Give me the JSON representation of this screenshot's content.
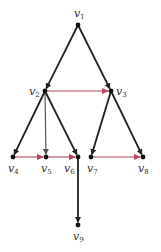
{
  "diagram": {
    "type": "directed-tree",
    "colors": {
      "tree_edge": "#222222",
      "light_edge": "#555555",
      "cross_edge": "#b04a5a",
      "node": "#111111"
    },
    "nodes": [
      {
        "id": "v1",
        "label": "v",
        "sub": "1",
        "x": 78,
        "y": 25,
        "lx": 74,
        "ly": 17
      },
      {
        "id": "v2",
        "label": "v",
        "sub": "2",
        "x": 45,
        "y": 91,
        "lx": 29,
        "ly": 95
      },
      {
        "id": "v3",
        "label": "v",
        "sub": "3",
        "x": 111,
        "y": 91,
        "lx": 116,
        "ly": 95
      },
      {
        "id": "v4",
        "label": "v",
        "sub": "4",
        "x": 13,
        "y": 157,
        "lx": 8,
        "ly": 172
      },
      {
        "id": "v5",
        "label": "v",
        "sub": "5",
        "x": 46,
        "y": 157,
        "lx": 41,
        "ly": 172
      },
      {
        "id": "v6",
        "label": "v",
        "sub": "6",
        "x": 78,
        "y": 157,
        "lx": 64,
        "ly": 172
      },
      {
        "id": "v7",
        "label": "v",
        "sub": "7",
        "x": 91,
        "y": 157,
        "lx": 87,
        "ly": 172
      },
      {
        "id": "v8",
        "label": "v",
        "sub": "8",
        "x": 143,
        "y": 157,
        "lx": 138,
        "ly": 172
      },
      {
        "id": "v9",
        "label": "v",
        "sub": "9",
        "x": 78,
        "y": 225,
        "lx": 73,
        "ly": 240
      }
    ],
    "edges": [
      {
        "from": "v1",
        "to": "v2",
        "kind": "tree"
      },
      {
        "from": "v1",
        "to": "v3",
        "kind": "tree"
      },
      {
        "from": "v2",
        "to": "v4",
        "kind": "tree"
      },
      {
        "from": "v2",
        "to": "v5",
        "kind": "light"
      },
      {
        "from": "v2",
        "to": "v6",
        "kind": "tree"
      },
      {
        "from": "v3",
        "to": "v7",
        "kind": "tree"
      },
      {
        "from": "v3",
        "to": "v8",
        "kind": "tree"
      },
      {
        "from": "v6",
        "to": "v9",
        "kind": "tree"
      },
      {
        "from": "v2",
        "to": "v3",
        "kind": "cross"
      },
      {
        "from": "v4",
        "to": "v5",
        "kind": "cross"
      },
      {
        "from": "v5",
        "to": "v6",
        "kind": "cross"
      },
      {
        "from": "v7",
        "to": "v8",
        "kind": "cross"
      }
    ]
  }
}
